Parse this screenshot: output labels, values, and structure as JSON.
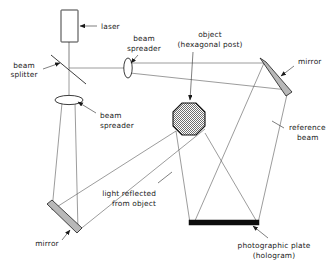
{
  "diagram": {
    "background_color": "#ffffff",
    "ink_color": "#1a1a1a",
    "labels": {
      "laser": "laser",
      "beam_splitter_line1": "beam",
      "beam_splitter_line2": "splitter",
      "beam_spreader_top_line1": "beam",
      "beam_spreader_top_line2": "spreader",
      "beam_spreader_bottom_line1": "beam",
      "beam_spreader_bottom_line2": "spreader",
      "object_line1": "object",
      "object_line2": "(hexagonal post)",
      "mirror_top_right": "mirror",
      "mirror_bottom_left": "mirror",
      "reference_beam_line1": "reference",
      "reference_beam_line2": "beam",
      "light_reflected_line1": "light reflected",
      "light_reflected_line2": "from object",
      "photographic_plate_line1": "photographic plate",
      "photographic_plate_line2": "(hologram)"
    },
    "components": {
      "laser_source": "laser-box",
      "beam_splitter": "beam-splitter-plate",
      "lens_top": "beam-spreader-lens-vertical",
      "lens_bottom": "beam-spreader-lens-horizontal",
      "object": "hexagonal-post-object",
      "mirror_a": "mirror-top-right",
      "mirror_b": "mirror-bottom-left",
      "recording_medium": "photographic-plate-hologram"
    },
    "colors": {
      "mirror_fill": "#b8b8b8",
      "plate_fill": "#0d0d0d",
      "object_fill": "#9a9a9a",
      "beam_stroke": "#3a3a3a"
    }
  }
}
